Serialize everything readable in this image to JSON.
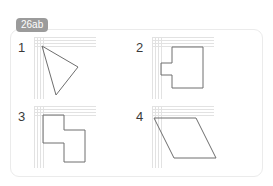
{
  "page": {
    "tab_label": "26ab",
    "background_color": "#ffffff",
    "card_border_color": "#ebebeb",
    "tab_color": "#9b9b9b",
    "tab_text_color": "#ffffff",
    "shape_stroke_color": "#6e6e6e",
    "grid_color": "#d9d9d9",
    "numeral_color": "#3a3a3a"
  },
  "exercises": [
    {
      "number": "1",
      "shape_name": "triangle",
      "grid": {
        "cols": 6,
        "rows": 6,
        "cell": 10.3
      },
      "points": "8,9 44,30 22,58"
    },
    {
      "number": "2",
      "shape_name": "rectangle-with-left-tab",
      "grid": {
        "cols": 6,
        "rows": 6,
        "cell": 10.3
      },
      "points": "20,10 51,10 51,51 20,51 20,38 9,38 9,26 20,26"
    },
    {
      "number": "3",
      "shape_name": "z-shaped-hexagon",
      "grid": {
        "cols": 6,
        "rows": 6,
        "cell": 10.3
      },
      "points": "9,9 30,9 30,24 51,24 51,56 30,56 30,37 9,37"
    },
    {
      "number": "4",
      "shape_name": "parallelogram",
      "grid": {
        "cols": 6,
        "rows": 6,
        "cell": 10.3
      },
      "points": "2,12 44,12 64,52 22,52"
    }
  ]
}
